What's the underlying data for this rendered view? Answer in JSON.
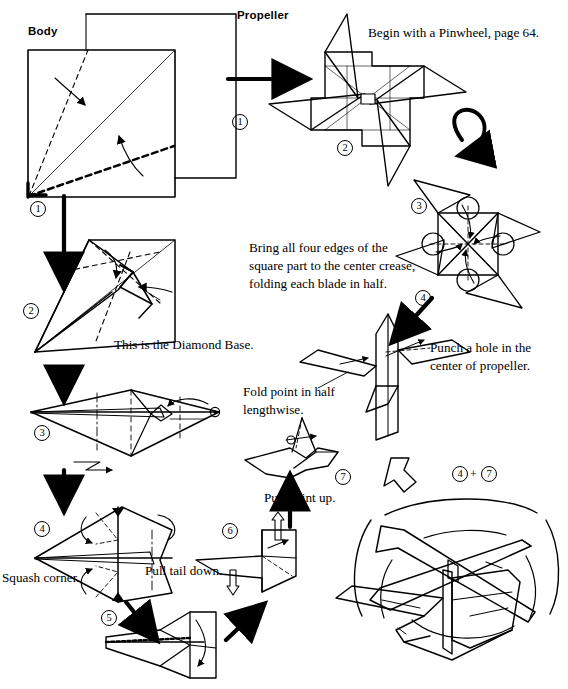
{
  "page": {
    "background": "#ffffff",
    "ink": "#000000",
    "width": 568,
    "height": 689
  },
  "labels": {
    "body": "Body",
    "propeller": "Propeller",
    "begin_pinwheel": "Begin with a Pinwheel, page 64.",
    "bring_edges_l1": "Bring all four edges of the",
    "bring_edges_l2": "square part to the center crease,",
    "bring_edges_l3": "folding each blade in half.",
    "punch_hole_l1": "Punch a hole in the",
    "punch_hole_l2": "center of propeller.",
    "diamond_base": "This is the Diamond Base.",
    "fold_point_l1": "Fold point in half",
    "fold_point_l2": "lengthwise.",
    "squash_corner": "Squash corner.",
    "pull_tail_down": "Pull tail down.",
    "pull_point_up": "Pull point up.",
    "combine": "+"
  },
  "steps": {
    "body_1": "1",
    "body_1b": "1",
    "body_2": "2",
    "body_3": "3",
    "body_4": "4",
    "body_5": "5",
    "body_6": "6",
    "body_7": "7",
    "prop_2": "2",
    "prop_3": "3",
    "prop_4": "4",
    "final_a": "4",
    "final_b": "7"
  }
}
